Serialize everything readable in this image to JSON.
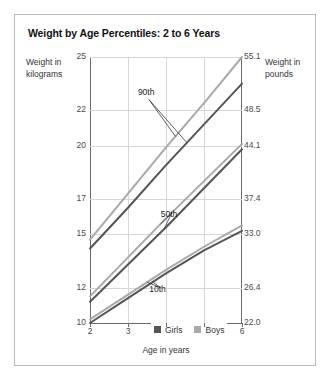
{
  "chart_data": {
    "type": "line",
    "title": "Weight by Age Percentiles: 2 to 6 Years",
    "xlabel": "Age in years",
    "ylabel": "Weight in kilograms",
    "ylabel_right": "Weight in pounds",
    "xlim": [
      2,
      6
    ],
    "ylim": [
      10,
      25
    ],
    "grid": true,
    "legend_position": "bottom-center",
    "x": [
      2,
      3,
      4,
      5,
      6
    ],
    "xticks": [
      "2",
      "3",
      "4",
      "5",
      "6"
    ],
    "yticks_left": [
      "25",
      "22",
      "20",
      "17",
      "15",
      "12",
      "10"
    ],
    "yticks_left_values": [
      25,
      22,
      20,
      17,
      15,
      12,
      10
    ],
    "yticks_right": [
      "55.1",
      "48.5",
      "44.1",
      "37.4",
      "33.0",
      "26.4",
      "22.0"
    ],
    "yticks_right_values": [
      55.1,
      48.5,
      44.1,
      37.4,
      33.0,
      26.4,
      22.0
    ],
    "series": [
      {
        "name": "Boys 90th",
        "group": "Boys",
        "percentile": "90th",
        "color": "#a9a9a9",
        "values": [
          14.7,
          17.3,
          19.9,
          22.4,
          25.0
        ]
      },
      {
        "name": "Girls 90th",
        "group": "Girls",
        "percentile": "90th",
        "color": "#555555",
        "values": [
          14.2,
          16.5,
          18.9,
          21.2,
          23.5
        ]
      },
      {
        "name": "Boys 50th",
        "group": "Boys",
        "percentile": "50th",
        "color": "#a9a9a9",
        "values": [
          11.5,
          13.7,
          15.9,
          18.0,
          20.1
        ]
      },
      {
        "name": "Girls 50th",
        "group": "Girls",
        "percentile": "50th",
        "color": "#555555",
        "values": [
          11.2,
          13.3,
          15.4,
          17.6,
          19.8
        ]
      },
      {
        "name": "Boys 10th",
        "group": "Boys",
        "percentile": "10th",
        "color": "#a9a9a9",
        "values": [
          10.2,
          11.6,
          13.0,
          14.3,
          15.5
        ]
      },
      {
        "name": "Girls 10th",
        "group": "Girls",
        "percentile": "10th",
        "color": "#555555",
        "values": [
          10.0,
          11.4,
          12.8,
          14.1,
          15.2
        ]
      }
    ],
    "annotations": [
      {
        "label": "90th",
        "x": 3.55,
        "y": 22.6
      },
      {
        "label": "50th",
        "x": 4.15,
        "y": 16.2
      },
      {
        "label": "10th",
        "x": 3.85,
        "y": 12.0
      }
    ],
    "legend": [
      {
        "label": "Girls",
        "color": "#555555"
      },
      {
        "label": "Boys",
        "color": "#a9a9a9"
      }
    ]
  },
  "accent_colors": {
    "girls": "#555555",
    "boys": "#a9a9a9",
    "grid": "#d6d6d6",
    "axis": "#6b6b6b",
    "frame": "#b9b9b9"
  }
}
